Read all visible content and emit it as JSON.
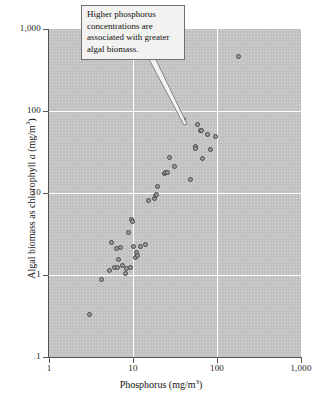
{
  "chart_data": {
    "type": "scatter",
    "title": "",
    "xlabel": "Phosphorus (mg/m3)",
    "ylabel": "Algal biomass as chlorophyll a (mg/m3)",
    "xscale": "log",
    "yscale": "log",
    "xlim": [
      1,
      1000
    ],
    "ylim": [
      0.1,
      1000
    ],
    "grid": true,
    "legend": null,
    "x_ticklabels": [
      "1",
      "10",
      "100",
      "1,000"
    ],
    "x_tickvalues": [
      1,
      10,
      100,
      1000
    ],
    "y_ticklabels": [
      ".1",
      "1",
      "10",
      "100",
      "1,000"
    ],
    "y_tickvalues": [
      0.1,
      1,
      10,
      100,
      1000
    ],
    "points": [
      {
        "x": 3.0,
        "y": 0.33
      },
      {
        "x": 4.2,
        "y": 0.89
      },
      {
        "x": 5.2,
        "y": 1.15
      },
      {
        "x": 5.6,
        "y": 2.5
      },
      {
        "x": 6.0,
        "y": 1.25
      },
      {
        "x": 6.3,
        "y": 2.1
      },
      {
        "x": 6.5,
        "y": 1.22
      },
      {
        "x": 6.8,
        "y": 1.55
      },
      {
        "x": 7.1,
        "y": 2.15
      },
      {
        "x": 7.6,
        "y": 1.3
      },
      {
        "x": 8.2,
        "y": 1.05
      },
      {
        "x": 8.4,
        "y": 1.2
      },
      {
        "x": 8.8,
        "y": 3.3
      },
      {
        "x": 9.3,
        "y": 1.25
      },
      {
        "x": 9.6,
        "y": 4.8
      },
      {
        "x": 9.9,
        "y": 4.5
      },
      {
        "x": 10.2,
        "y": 2.2
      },
      {
        "x": 10.6,
        "y": 1.65
      },
      {
        "x": 11.0,
        "y": 1.9
      },
      {
        "x": 11.4,
        "y": 1.75
      },
      {
        "x": 12.4,
        "y": 2.25
      },
      {
        "x": 14.2,
        "y": 2.35
      },
      {
        "x": 15.5,
        "y": 8.1
      },
      {
        "x": 17.8,
        "y": 8.6
      },
      {
        "x": 18.4,
        "y": 9.2
      },
      {
        "x": 18.9,
        "y": 9.5
      },
      {
        "x": 19.6,
        "y": 12.0
      },
      {
        "x": 23.5,
        "y": 17.5
      },
      {
        "x": 24.3,
        "y": 17.8
      },
      {
        "x": 25.4,
        "y": 18.0
      },
      {
        "x": 27.5,
        "y": 27.0
      },
      {
        "x": 31.0,
        "y": 21.0
      },
      {
        "x": 40.0,
        "y": 78.0
      },
      {
        "x": 48.0,
        "y": 14.5
      },
      {
        "x": 55.0,
        "y": 37.0
      },
      {
        "x": 56.0,
        "y": 35.0
      },
      {
        "x": 58.0,
        "y": 68.0
      },
      {
        "x": 63.0,
        "y": 58.0
      },
      {
        "x": 66.0,
        "y": 58.0
      },
      {
        "x": 68.0,
        "y": 26.0
      },
      {
        "x": 78.0,
        "y": 52.0
      },
      {
        "x": 83.0,
        "y": 34.0
      },
      {
        "x": 96.0,
        "y": 49.0
      },
      {
        "x": 180.0,
        "y": 460.0
      }
    ]
  },
  "annotation": {
    "text": "Higher phosphorus concentrations are associated with greater algal biomass.",
    "target_x": 40.0,
    "target_y": 78.0
  },
  "colors": {
    "panel": "#c2c2c2",
    "gridline": "#ffffff",
    "marker_fill": "#9a9a9a",
    "marker_edge": "#4a4a4a",
    "axis": "#555555",
    "callout_bg": "#f2f2f0",
    "callout_border": "#6f6f6f",
    "text": "#111111"
  },
  "axis_title_parts": {
    "x_main": "Phosphorus (mg/m",
    "x_sup": "3",
    "x_end": ")",
    "y_pre": "Algal biomass as chlorophyll ",
    "y_ital": "a",
    "y_mid": " (mg/m",
    "y_sup": "3",
    "y_end": ")"
  }
}
